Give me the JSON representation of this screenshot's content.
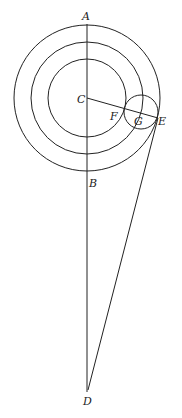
{
  "labels": {
    "A": "A",
    "B": "B",
    "C": "C",
    "D": "D",
    "E": "E",
    "F": "F",
    "G": "G"
  },
  "colors": {
    "stroke": "#222222",
    "background": "#ffffff"
  }
}
